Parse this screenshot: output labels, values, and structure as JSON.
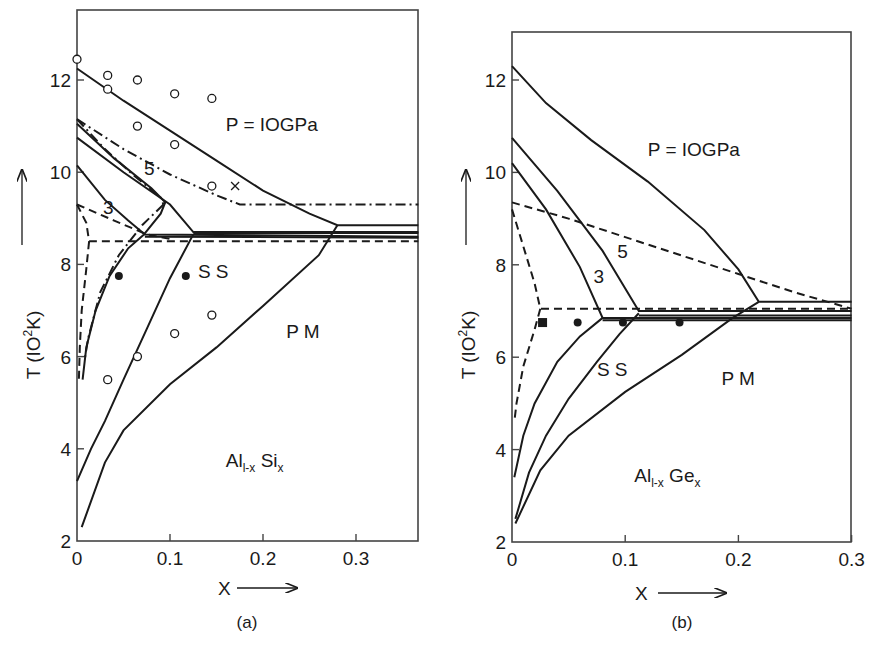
{
  "chart_data": [
    {
      "type": "line",
      "panel": "(a)",
      "title": "",
      "xlabel": "X",
      "ylabel": "T (IO2K)",
      "xlim": [
        0,
        0.367
      ],
      "ylim": [
        2,
        13.5
      ],
      "xticks": [
        0,
        0.1,
        0.2,
        0.3
      ],
      "xtick_labels": [
        "0",
        "0.1",
        "0.2",
        "0.3"
      ],
      "yticks": [
        2,
        4,
        6,
        8,
        10,
        12
      ],
      "ytick_labels": [
        "2",
        "4",
        "6",
        "8",
        "10",
        "12"
      ],
      "grid": false,
      "annotations": [
        {
          "text": "P = IOGPa",
          "x": 0.16,
          "y": 10.9
        },
        {
          "text": "5",
          "x": 0.072,
          "y": 9.95
        },
        {
          "text": "3",
          "x": 0.028,
          "y": 9.1
        },
        {
          "text": "S  S",
          "x": 0.13,
          "y": 7.7
        },
        {
          "text": "P M",
          "x": 0.225,
          "y": 6.4
        },
        {
          "text": "Al",
          "sub": "l-x",
          "text2": " Si",
          "sub2": "x",
          "x": 0.16,
          "y": 3.6
        }
      ],
      "series": [
        {
          "name": "P=10GPa upper solid",
          "style": "solid",
          "points": [
            [
              0,
              12.25
            ],
            [
              0.05,
              11.55
            ],
            [
              0.1,
              10.9
            ],
            [
              0.15,
              10.25
            ],
            [
              0.2,
              9.6
            ],
            [
              0.25,
              9.1
            ],
            [
              0.28,
              8.85
            ],
            [
              0.367,
              8.85
            ]
          ]
        },
        {
          "name": "5GPa solid upper",
          "style": "solid",
          "points": [
            [
              0,
              10.75
            ],
            [
              0.05,
              10.0
            ],
            [
              0.1,
              9.3
            ],
            [
              0.125,
              8.7
            ],
            [
              0.367,
              8.7
            ]
          ]
        },
        {
          "name": "3GPa solid upper",
          "style": "solid",
          "points": [
            [
              0,
              10.15
            ],
            [
              0.03,
              9.4
            ],
            [
              0.055,
              8.95
            ],
            [
              0.073,
              8.65
            ],
            [
              0.367,
              8.6
            ]
          ]
        },
        {
          "name": "ambient dashed upper",
          "style": "dashed",
          "points": [
            [
              0,
              9.3
            ],
            [
              0.04,
              8.95
            ],
            [
              0.075,
              8.65
            ],
            [
              0.1,
              8.55
            ]
          ]
        },
        {
          "name": "dash-dot upper",
          "style": "dashdot",
          "points": [
            [
              0,
              11.15
            ],
            [
              0.05,
              10.5
            ],
            [
              0.1,
              9.95
            ],
            [
              0.15,
              9.5
            ],
            [
              0.175,
              9.3
            ],
            [
              0.367,
              9.3
            ]
          ]
        },
        {
          "name": "dash-dot inner",
          "style": "dashdot",
          "points": [
            [
              0,
              11.15
            ],
            [
              0.03,
              10.5
            ],
            [
              0.06,
              9.95
            ],
            [
              0.09,
              9.45
            ],
            [
              0.093,
              9.3
            ]
          ]
        },
        {
          "name": "5GPa inner solid",
          "style": "solid",
          "points": [
            [
              0,
              11.05
            ],
            [
              0.04,
              10.3
            ],
            [
              0.08,
              9.65
            ],
            [
              0.095,
              9.35
            ],
            [
              0.09,
              9.1
            ],
            [
              0.072,
              8.65
            ]
          ]
        },
        {
          "name": "SS left solid",
          "style": "solid",
          "points": [
            [
              0.072,
              8.65
            ],
            [
              0.055,
              8.35
            ],
            [
              0.035,
              7.75
            ],
            [
              0.02,
              7.0
            ],
            [
              0.01,
              6.2
            ],
            [
              0.006,
              5.5
            ]
          ]
        },
        {
          "name": "SS left dash-dot",
          "style": "dashdot",
          "points": [
            [
              0.093,
              9.3
            ],
            [
              0.07,
              8.85
            ],
            [
              0.045,
              8.2
            ],
            [
              0.025,
              7.4
            ],
            [
              0.012,
              6.4
            ],
            [
              0.008,
              5.9
            ]
          ]
        },
        {
          "name": "ambient dashed corner",
          "style": "dashed",
          "points": [
            [
              0,
              9.3
            ],
            [
              0.01,
              8.9
            ],
            [
              0.013,
              8.5
            ],
            [
              0.367,
              8.5
            ]
          ]
        },
        {
          "name": "ambient dashed left",
          "style": "dashed",
          "points": [
            [
              0.013,
              8.5
            ],
            [
              0.01,
              7.9
            ],
            [
              0.005,
              7.0
            ],
            [
              0.003,
              6.2
            ],
            [
              0.002,
              5.5
            ]
          ]
        },
        {
          "name": "SS middle solid",
          "style": "solid",
          "points": [
            [
              0.125,
              8.65
            ],
            [
              0.1,
              7.7
            ],
            [
              0.075,
              6.6
            ],
            [
              0.05,
              5.5
            ],
            [
              0.03,
              4.6
            ],
            [
              0.015,
              4.0
            ],
            [
              0,
              3.3
            ]
          ]
        },
        {
          "name": "SS-PM boundary",
          "style": "solid",
          "points": [
            [
              0.28,
              8.85
            ],
            [
              0.26,
              8.2
            ],
            [
              0.2,
              7.1
            ],
            [
              0.15,
              6.2
            ],
            [
              0.1,
              5.4
            ],
            [
              0.05,
              4.4
            ],
            [
              0.03,
              3.7
            ],
            [
              0.005,
              2.3
            ]
          ]
        },
        {
          "name": "middle horizontal solid",
          "style": "solid",
          "points": [
            [
              0.073,
              8.6
            ],
            [
              0.367,
              8.58
            ]
          ]
        },
        {
          "name": "lower horizontal solid",
          "style": "solid",
          "points": [
            [
              0.125,
              8.68
            ],
            [
              0.367,
              8.68
            ]
          ]
        }
      ],
      "markers": {
        "open_circles": [
          [
            0,
            12.45
          ],
          [
            0.033,
            12.1
          ],
          [
            0.033,
            11.8
          ],
          [
            0.065,
            12.0
          ],
          [
            0.105,
            11.7
          ],
          [
            0.145,
            11.6
          ],
          [
            0.065,
            11.0
          ],
          [
            0.105,
            10.6
          ],
          [
            0.145,
            9.7
          ],
          [
            0.145,
            6.9
          ],
          [
            0.105,
            6.5
          ],
          [
            0.065,
            6.0
          ],
          [
            0.033,
            5.5
          ]
        ],
        "filled_circles": [
          [
            0.045,
            7.75
          ],
          [
            0.117,
            7.75
          ]
        ],
        "crosses": [
          [
            0.17,
            9.7
          ]
        ]
      }
    },
    {
      "type": "line",
      "panel": "(b)",
      "title": "",
      "xlabel": "X",
      "ylabel": "T (IO2K)",
      "xlim": [
        0,
        0.3
      ],
      "ylim": [
        2,
        13.05
      ],
      "xticks": [
        0,
        0.1,
        0.2,
        0.3
      ],
      "xtick_labels": [
        "0",
        "0.1",
        "0.2",
        "0.3"
      ],
      "yticks": [
        2,
        4,
        6,
        8,
        10,
        12
      ],
      "ytick_labels": [
        "2",
        "4",
        "6",
        "8",
        "10",
        "12"
      ],
      "grid": false,
      "annotations": [
        {
          "text": "P = IOGPa",
          "x": 0.12,
          "y": 10.35
        },
        {
          "text": "5",
          "x": 0.093,
          "y": 8.15
        },
        {
          "text": "3",
          "x": 0.072,
          "y": 7.6
        },
        {
          "text": "S  S",
          "x": 0.075,
          "y": 5.6
        },
        {
          "text": "P M",
          "x": 0.185,
          "y": 5.4
        },
        {
          "text": "Al",
          "sub": "l-x",
          "text2": " Ge",
          "sub2": "x",
          "x": 0.108,
          "y": 3.3
        }
      ],
      "series": [
        {
          "name": "P=10GPa upper solid",
          "style": "solid",
          "points": [
            [
              0,
              12.3
            ],
            [
              0.03,
              11.5
            ],
            [
              0.07,
              10.7
            ],
            [
              0.12,
              9.8
            ],
            [
              0.17,
              8.75
            ],
            [
              0.2,
              7.9
            ],
            [
              0.218,
              7.2
            ],
            [
              0.3,
              7.2
            ]
          ]
        },
        {
          "name": "5GPa solid",
          "style": "solid",
          "points": [
            [
              0,
              10.75
            ],
            [
              0.04,
              9.6
            ],
            [
              0.08,
              8.3
            ],
            [
              0.112,
              7.0
            ],
            [
              0.3,
              7.0
            ]
          ]
        },
        {
          "name": "3GPa solid",
          "style": "solid",
          "points": [
            [
              0,
              10.2
            ],
            [
              0.03,
              9.2
            ],
            [
              0.06,
              7.95
            ],
            [
              0.08,
              6.85
            ],
            [
              0.3,
              6.85
            ]
          ]
        },
        {
          "name": "ambient dashed upper",
          "style": "dashed",
          "points": [
            [
              0,
              9.35
            ],
            [
              0.05,
              9.0
            ],
            [
              0.1,
              8.6
            ],
            [
              0.15,
              8.2
            ],
            [
              0.2,
              7.8
            ],
            [
              0.25,
              7.4
            ],
            [
              0.3,
              7.05
            ]
          ]
        },
        {
          "name": "ambient dashed left",
          "style": "dashed",
          "points": [
            [
              0,
              9.2
            ],
            [
              0.01,
              8.4
            ],
            [
              0.02,
              7.6
            ],
            [
              0.025,
              7.05
            ],
            [
              0.3,
              7.05
            ]
          ]
        },
        {
          "name": "ambient dashed lower",
          "style": "dashed",
          "points": [
            [
              0.025,
              7.05
            ],
            [
              0.02,
              6.6
            ],
            [
              0.01,
              5.8
            ],
            [
              0.004,
              5.0
            ],
            [
              0.002,
              4.6
            ]
          ]
        },
        {
          "name": "SS left solid",
          "style": "solid",
          "points": [
            [
              0.08,
              6.85
            ],
            [
              0.06,
              6.45
            ],
            [
              0.04,
              5.9
            ],
            [
              0.02,
              5.0
            ],
            [
              0.01,
              4.3
            ],
            [
              0.002,
              3.4
            ]
          ]
        },
        {
          "name": "SS middle solid",
          "style": "solid",
          "points": [
            [
              0.112,
              6.95
            ],
            [
              0.095,
              6.5
            ],
            [
              0.075,
              5.9
            ],
            [
              0.05,
              5.1
            ],
            [
              0.03,
              4.3
            ],
            [
              0.015,
              3.5
            ],
            [
              0.003,
              2.5
            ]
          ]
        },
        {
          "name": "SS-PM boundary",
          "style": "solid",
          "points": [
            [
              0.218,
              7.2
            ],
            [
              0.195,
              6.85
            ],
            [
              0.15,
              6.05
            ],
            [
              0.1,
              5.25
            ],
            [
              0.05,
              4.3
            ],
            [
              0.025,
              3.55
            ],
            [
              0.003,
              2.4
            ]
          ]
        },
        {
          "name": "horizontal solid 3",
          "style": "solid",
          "points": [
            [
              0.08,
              6.8
            ],
            [
              0.3,
              6.8
            ]
          ]
        },
        {
          "name": "horizontal solid 4",
          "style": "solid",
          "points": [
            [
              0.112,
              6.9
            ],
            [
              0.3,
              6.9
            ]
          ]
        }
      ],
      "markers": {
        "filled_squares": [
          [
            0.027,
            6.75
          ]
        ],
        "filled_circles": [
          [
            0.058,
            6.75
          ],
          [
            0.098,
            6.75
          ],
          [
            0.148,
            6.75
          ]
        ]
      }
    }
  ],
  "panels": {
    "a": {
      "label": "(a)",
      "x_axis_label": "X",
      "y_axis_label": "T (IO",
      "y_axis_sup": "2",
      "y_axis_unit": "K)"
    },
    "b": {
      "label": "(b)",
      "x_axis_label": "X",
      "y_axis_label": "T (IO",
      "y_axis_sup": "2",
      "y_axis_unit": "K)"
    }
  }
}
